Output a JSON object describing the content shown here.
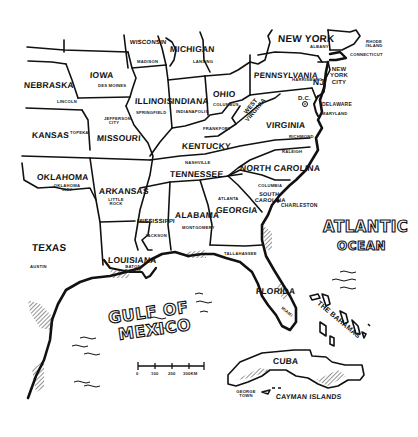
{
  "map": {
    "title": "Eastern United States",
    "states": [
      {
        "name": "WISCONSIN",
        "capital": "MADISON"
      },
      {
        "name": "MICHIGAN",
        "capital": "LANSING"
      },
      {
        "name": "NEW YORK",
        "capital": "ALBANY"
      },
      {
        "name": "NEBRASKA",
        "capital": "LINCOLN"
      },
      {
        "name": "IOWA",
        "capital": "DES MOINES"
      },
      {
        "name": "ILLINOIS",
        "capital": "SPRINGFIELD"
      },
      {
        "name": "INDIANA",
        "capital": "INDIANAPOLIS"
      },
      {
        "name": "OHIO",
        "capital": "COLUMBUS"
      },
      {
        "name": "PENNSYLVANIA",
        "capital": "HARRISBURG"
      },
      {
        "name": "NJ",
        "capital": ""
      },
      {
        "name": "KANSAS",
        "capital": "TOPEKA"
      },
      {
        "name": "MISSOURI",
        "capital": "JEFFERSON CITY"
      },
      {
        "name": "WEST VIRGINIA",
        "capital": ""
      },
      {
        "name": "VIRGINIA",
        "capital": "RICHMOND"
      },
      {
        "name": "KENTUCKY",
        "capital": "FRANKFORT"
      },
      {
        "name": "TENNESSEE",
        "capital": "NASHVILLE"
      },
      {
        "name": "NORTH CAROLINA",
        "capital": "RALEIGH"
      },
      {
        "name": "OKLAHOMA",
        "capital": "OKLAHOMA CITY"
      },
      {
        "name": "ARKANSAS",
        "capital": "LITTLE ROCK"
      },
      {
        "name": "SOUTH CAROLINA",
        "capital": "COLUMBIA"
      },
      {
        "name": "MISSISSIPPI",
        "capital": "JACKSON"
      },
      {
        "name": "ALABAMA",
        "capital": "MONTGOMERY"
      },
      {
        "name": "GEORGIA",
        "capital": "ATLANTA"
      },
      {
        "name": "TEXAS",
        "capital": "AUSTIN"
      },
      {
        "name": "LOUISIANA",
        "capital": "BATON ROUGE"
      },
      {
        "name": "FLORIDA",
        "capital": "TALLAHASSEE"
      }
    ],
    "other_labels": {
      "rhode_island": "RHODE ISLAND",
      "connecticut": "CONNECTICUT",
      "new_york_city": "NEW YORK CITY",
      "dc": "D.C.",
      "delaware": "DELAWARE",
      "maryland": "MARYLAND",
      "charleston": "CHARLESTON",
      "miami": "MIAMI",
      "atlantic_1": "ATLANTIC",
      "atlantic_2": "OCEAN",
      "gulf_1": "GULF OF",
      "gulf_2": "MEXICO",
      "bahamas": "THE BAHAMAS",
      "cuba": "CUBA",
      "cayman": "CAYMAN ISLANDS",
      "george_town": "GEORGE TOWN"
    },
    "scale_bar": {
      "ticks": [
        "0",
        "100",
        "200",
        "300KM"
      ]
    }
  }
}
